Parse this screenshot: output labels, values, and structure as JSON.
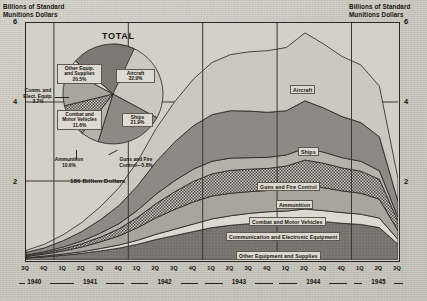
{
  "axis_titles": {
    "left": "Billions of Standard\nMunitions Dollars",
    "right": "Billions of Standard\nMunitions Dollars"
  },
  "pie": {
    "title": "TOTAL",
    "total_label": "186 Billion Dollars",
    "slices": [
      {
        "name": "Aircraft",
        "label": "Aircraft\n32.9%",
        "value": 32.9
      },
      {
        "name": "Ships",
        "label": "Ships\n21.9%",
        "value": 21.9
      },
      {
        "name": "Guns and Fire Control",
        "label": "Guns and Fire\nControl—5.8%",
        "value": 5.8
      },
      {
        "name": "Ammunition",
        "label": "Ammunition\n10.6%",
        "value": 10.6
      },
      {
        "name": "Combat and Motor Vehicles",
        "label": "Combat and\nMotor Vehicles\n11.6%",
        "value": 11.6
      },
      {
        "name": "Communication and Electronic Equipment",
        "label": "Comm. and\nElect. Equip.\n3.7%",
        "value": 3.7
      },
      {
        "name": "Other Equipment and Supplies",
        "label": "Other Equip.\nand Supplies\n20.5%",
        "value": 20.5
      }
    ]
  },
  "chart_data": {
    "type": "area",
    "xlabel": "",
    "ylabel": "Billions of Standard Munitions Dollars",
    "ylim": [
      0,
      6
    ],
    "yticks": [
      0,
      2,
      4,
      6
    ],
    "ytick_labels": [
      "0",
      "2",
      "4",
      "6"
    ],
    "grid": true,
    "legend": "inline band labels",
    "stacked": true,
    "x": [
      "3Q 1940",
      "4Q 1940",
      "1Q 1941",
      "2Q 1941",
      "3Q 1941",
      "4Q 1941",
      "1Q 1942",
      "2Q 1942",
      "3Q 1942",
      "4Q 1942",
      "1Q 1943",
      "2Q 1943",
      "3Q 1943",
      "4Q 1943",
      "1Q 1944",
      "2Q 1944",
      "3Q 1944",
      "4Q 1944",
      "1Q 1945",
      "2Q 1945",
      "3Q 1945"
    ],
    "quarter_labels": [
      "3Q",
      "4Q",
      "1Q",
      "2Q",
      "3Q",
      "4Q",
      "1Q",
      "2Q",
      "3Q",
      "4Q",
      "1Q",
      "2Q",
      "3Q",
      "4Q",
      "1Q",
      "2Q",
      "3Q",
      "4Q",
      "1Q",
      "2Q",
      "3Q"
    ],
    "years": [
      {
        "label": "1940",
        "quarters": 2
      },
      {
        "label": "1941",
        "quarters": 4
      },
      {
        "label": "1942",
        "quarters": 4
      },
      {
        "label": "1943",
        "quarters": 4
      },
      {
        "label": "1944",
        "quarters": 4
      },
      {
        "label": "1945",
        "quarters": 3
      }
    ],
    "series": [
      {
        "name": "Other Equipment and Supplies",
        "values": [
          0.05,
          0.08,
          0.12,
          0.17,
          0.23,
          0.3,
          0.4,
          0.52,
          0.62,
          0.72,
          0.82,
          0.88,
          0.92,
          0.95,
          0.96,
          1.0,
          0.97,
          0.93,
          0.9,
          0.82,
          0.4
        ]
      },
      {
        "name": "Communication and Electronic Equipment",
        "values": [
          0.01,
          0.02,
          0.03,
          0.04,
          0.06,
          0.08,
          0.1,
          0.13,
          0.16,
          0.19,
          0.22,
          0.24,
          0.26,
          0.27,
          0.28,
          0.29,
          0.28,
          0.27,
          0.26,
          0.24,
          0.12
        ]
      },
      {
        "name": "Combat and Motor Vehicles",
        "values": [
          0.03,
          0.05,
          0.08,
          0.12,
          0.17,
          0.23,
          0.32,
          0.42,
          0.5,
          0.56,
          0.58,
          0.57,
          0.55,
          0.54,
          0.56,
          0.6,
          0.58,
          0.55,
          0.53,
          0.48,
          0.22
        ]
      },
      {
        "name": "Ammunition",
        "values": [
          0.02,
          0.03,
          0.05,
          0.08,
          0.12,
          0.18,
          0.26,
          0.36,
          0.45,
          0.52,
          0.56,
          0.58,
          0.57,
          0.56,
          0.58,
          0.64,
          0.62,
          0.58,
          0.56,
          0.5,
          0.24
        ]
      },
      {
        "name": "Guns and Fire Control",
        "values": [
          0.02,
          0.03,
          0.05,
          0.07,
          0.1,
          0.13,
          0.18,
          0.24,
          0.28,
          0.31,
          0.32,
          0.31,
          0.29,
          0.28,
          0.28,
          0.3,
          0.28,
          0.26,
          0.25,
          0.22,
          0.1
        ]
      },
      {
        "name": "Ships",
        "values": [
          0.06,
          0.1,
          0.16,
          0.24,
          0.34,
          0.46,
          0.62,
          0.82,
          0.98,
          1.1,
          1.18,
          1.2,
          1.18,
          1.14,
          1.12,
          1.2,
          1.12,
          1.04,
          0.98,
          0.86,
          0.4
        ]
      },
      {
        "name": "Aircraft",
        "values": [
          0.05,
          0.09,
          0.15,
          0.23,
          0.33,
          0.45,
          0.62,
          0.84,
          1.02,
          1.18,
          1.32,
          1.42,
          1.5,
          1.56,
          1.6,
          1.72,
          1.62,
          1.52,
          1.46,
          1.28,
          0.58
        ]
      }
    ],
    "band_labels": [
      "Aircraft",
      "Ships",
      "Guns and Fire Control",
      "Ammunition",
      "Combat and Motor Vehicles",
      "Communication and Electronic Equipment",
      "Other Equipment and Supplies"
    ]
  },
  "colors": {
    "paper": "#cfcdc6",
    "ink": "#2a2722",
    "aircraft": "#cbc8c0",
    "ships": "#8d8a83",
    "guns": "#b5b2aa",
    "ammunition": "#8f8c85",
    "combat": "#a8a59d",
    "communication": "#dcd9d1",
    "other": "#7c7972"
  }
}
